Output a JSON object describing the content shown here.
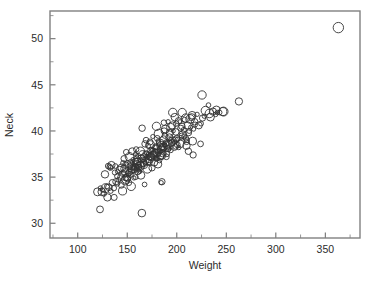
{
  "chart_data": {
    "type": "scatter",
    "title": "",
    "subtitle": "",
    "xlabel": "Weight",
    "ylabel": "Neck",
    "xlim": [
      72,
      385
    ],
    "ylim": [
      28.4,
      53.0
    ],
    "grid": false,
    "legend": null,
    "legend_position": "none",
    "marker": "open-circle",
    "marker_color": "#333333",
    "frame_color": "#808080",
    "xticks": [
      100,
      150,
      200,
      250,
      300,
      350
    ],
    "xtick_labels": [
      "100",
      "150",
      "200",
      "250",
      "300",
      "350"
    ],
    "xminor_step": 25,
    "yticks": [
      30,
      35,
      40,
      45,
      50
    ],
    "ytick_labels": [
      "30",
      "35",
      "40",
      "45",
      "50"
    ],
    "yminor_step": 2.5,
    "annotations": [
      {
        "text": "high-leverage outlier",
        "x": 363.15,
        "y": 51.2
      }
    ],
    "points": [
      [
        154.25,
        36.2
      ],
      [
        173.25,
        38.5
      ],
      [
        154.0,
        34.0
      ],
      [
        184.75,
        37.4
      ],
      [
        184.25,
        34.4
      ],
      [
        210.25,
        39.0
      ],
      [
        181.0,
        36.4
      ],
      [
        176.0,
        37.8
      ],
      [
        191.0,
        38.1
      ],
      [
        198.25,
        39.0
      ],
      [
        186.25,
        38.2
      ],
      [
        216.0,
        38.9
      ],
      [
        180.5,
        38.1
      ],
      [
        205.25,
        40.5
      ],
      [
        187.75,
        38.5
      ],
      [
        162.75,
        35.6
      ],
      [
        195.75,
        38.9
      ],
      [
        209.25,
        39.2
      ],
      [
        183.75,
        37.3
      ],
      [
        211.75,
        37.8
      ],
      [
        179.0,
        37.0
      ],
      [
        200.5,
        38.5
      ],
      [
        140.25,
        35.6
      ],
      [
        148.75,
        34.8
      ],
      [
        151.25,
        35.4
      ],
      [
        159.25,
        36.6
      ],
      [
        131.5,
        33.9
      ],
      [
        148.0,
        35.5
      ],
      [
        133.25,
        33.5
      ],
      [
        160.75,
        36.0
      ],
      [
        182.0,
        37.5
      ],
      [
        160.25,
        36.0
      ],
      [
        168.0,
        36.5
      ],
      [
        218.5,
        40.7
      ],
      [
        247.25,
        42.1
      ],
      [
        191.75,
        38.5
      ],
      [
        145.25,
        33.5
      ],
      [
        124.25,
        33.4
      ],
      [
        159.75,
        36.4
      ],
      [
        147.0,
        35.9
      ],
      [
        178.5,
        38.2
      ],
      [
        183.5,
        37.2
      ],
      [
        153.0,
        35.3
      ],
      [
        209.75,
        38.4
      ],
      [
        160.5,
        35.6
      ],
      [
        184.25,
        38.4
      ],
      [
        174.0,
        37.2
      ],
      [
        176.75,
        37.5
      ],
      [
        186.0,
        38.0
      ],
      [
        193.5,
        38.8
      ],
      [
        166.75,
        37.2
      ],
      [
        160.5,
        36.7
      ],
      [
        189.0,
        38.6
      ],
      [
        185.0,
        38.3
      ],
      [
        178.0,
        37.7
      ],
      [
        138.5,
        34.5
      ],
      [
        172.75,
        37.0
      ],
      [
        170.0,
        37.2
      ],
      [
        150.0,
        35.0
      ],
      [
        163.0,
        36.2
      ],
      [
        154.25,
        35.7
      ],
      [
        170.75,
        36.8
      ],
      [
        194.75,
        38.9
      ],
      [
        224.5,
        40.8
      ],
      [
        227.75,
        41.6
      ],
      [
        161.25,
        36.3
      ],
      [
        155.5,
        35.9
      ],
      [
        212.5,
        40.0
      ],
      [
        204.5,
        39.3
      ],
      [
        183.0,
        37.8
      ],
      [
        178.25,
        37.6
      ],
      [
        200.0,
        39.2
      ],
      [
        158.0,
        36.1
      ],
      [
        172.25,
        37.1
      ],
      [
        166.5,
        36.5
      ],
      [
        156.0,
        36.0
      ],
      [
        186.5,
        38.3
      ],
      [
        190.5,
        38.6
      ],
      [
        212.0,
        39.8
      ],
      [
        239.25,
        41.8
      ],
      [
        205.0,
        39.5
      ],
      [
        168.5,
        36.8
      ],
      [
        176.0,
        37.4
      ],
      [
        148.25,
        34.9
      ],
      [
        140.0,
        34.3
      ],
      [
        152.0,
        35.5
      ],
      [
        180.0,
        37.6
      ],
      [
        195.0,
        38.7
      ],
      [
        201.0,
        39.1
      ],
      [
        163.5,
        36.4
      ],
      [
        143.75,
        35.0
      ],
      [
        136.5,
        33.8
      ],
      [
        126.5,
        33.2
      ],
      [
        122.5,
        31.5
      ],
      [
        130.0,
        32.8
      ],
      [
        150.25,
        34.8
      ],
      [
        175.5,
        37.3
      ],
      [
        184.0,
        38.0
      ],
      [
        157.75,
        36.0
      ],
      [
        207.5,
        39.4
      ],
      [
        217.0,
        40.2
      ],
      [
        222.25,
        40.6
      ],
      [
        234.0,
        41.5
      ],
      [
        243.25,
        42.0
      ],
      [
        262.75,
        43.2
      ],
      [
        225.5,
        43.9
      ],
      [
        196.0,
        42.0
      ],
      [
        205.5,
        42.0
      ],
      [
        213.5,
        41.3
      ],
      [
        232.0,
        42.8
      ],
      [
        236.5,
        42.1
      ],
      [
        241.0,
        42.0
      ],
      [
        246.5,
        42.1
      ],
      [
        198.0,
        41.5
      ],
      [
        187.0,
        40.9
      ],
      [
        191.25,
        41.0
      ],
      [
        179.5,
        40.5
      ],
      [
        168.0,
        38.6
      ],
      [
        173.0,
        38.8
      ],
      [
        181.5,
        38.9
      ],
      [
        199.5,
        40.8
      ],
      [
        203.25,
        41.0
      ],
      [
        208.0,
        41.2
      ],
      [
        215.0,
        41.5
      ],
      [
        220.5,
        41.8
      ],
      [
        229.0,
        42.2
      ],
      [
        165.0,
        40.3
      ],
      [
        155.0,
        37.8
      ],
      [
        149.0,
        37.7
      ],
      [
        159.0,
        38.0
      ],
      [
        146.0,
        36.5
      ],
      [
        138.0,
        36.2
      ],
      [
        134.0,
        36.3
      ],
      [
        132.25,
        36.1
      ],
      [
        128.0,
        33.8
      ],
      [
        136.75,
        32.8
      ],
      [
        164.75,
        31.1
      ],
      [
        185.0,
        34.5
      ],
      [
        167.5,
        34.2
      ],
      [
        216.5,
        37.4
      ],
      [
        224.0,
        38.6
      ],
      [
        144.0,
        34.1
      ],
      [
        151.5,
        34.4
      ],
      [
        158.5,
        35.0
      ],
      [
        170.25,
        35.9
      ],
      [
        177.0,
        36.6
      ],
      [
        189.5,
        37.2
      ],
      [
        194.0,
        37.9
      ],
      [
        202.0,
        38.2
      ],
      [
        210.0,
        38.8
      ],
      [
        163.75,
        35.2
      ],
      [
        156.75,
        34.9
      ],
      [
        147.75,
        34.6
      ],
      [
        141.0,
        34.7
      ],
      [
        175.0,
        36.0
      ],
      [
        182.5,
        36.8
      ],
      [
        190.0,
        37.5
      ],
      [
        197.5,
        38.4
      ],
      [
        206.0,
        39.6
      ],
      [
        214.0,
        40.4
      ],
      [
        166.0,
        36.9
      ],
      [
        171.5,
        37.4
      ],
      [
        178.75,
        38.3
      ],
      [
        186.75,
        39.0
      ],
      [
        193.0,
        39.8
      ],
      [
        152.5,
        36.2
      ],
      [
        158.75,
        36.7
      ],
      [
        164.25,
        37.0
      ],
      [
        169.75,
        37.6
      ],
      [
        174.5,
        38.0
      ],
      [
        145.5,
        35.4
      ],
      [
        139.75,
        35.1
      ],
      [
        135.0,
        34.4
      ],
      [
        129.5,
        34.0
      ],
      [
        125.0,
        33.6
      ],
      [
        180.25,
        39.2
      ],
      [
        188.0,
        39.5
      ],
      [
        196.5,
        40.0
      ],
      [
        204.0,
        40.3
      ],
      [
        211.0,
        40.6
      ],
      [
        161.0,
        37.3
      ],
      [
        155.75,
        36.9
      ],
      [
        150.5,
        36.4
      ],
      [
        144.5,
        36.0
      ],
      [
        137.5,
        35.5
      ],
      [
        173.75,
        37.9
      ],
      [
        168.75,
        37.5
      ],
      [
        183.25,
        38.7
      ],
      [
        192.5,
        39.3
      ],
      [
        199.0,
        39.9
      ],
      [
        207.0,
        40.1
      ],
      [
        218.0,
        41.0
      ],
      [
        226.0,
        41.4
      ],
      [
        233.0,
        41.9
      ],
      [
        240.0,
        42.3
      ],
      [
        157.0,
        35.8
      ],
      [
        162.0,
        36.1
      ],
      [
        167.0,
        36.3
      ],
      [
        172.0,
        36.6
      ],
      [
        177.5,
        37.1
      ],
      [
        142.5,
        35.8
      ],
      [
        148.5,
        36.3
      ],
      [
        153.5,
        36.6
      ],
      [
        159.5,
        37.0
      ],
      [
        165.5,
        37.4
      ],
      [
        179.75,
        37.0
      ],
      [
        185.5,
        37.6
      ],
      [
        192.0,
        38.0
      ],
      [
        198.75,
        38.3
      ],
      [
        203.5,
        38.6
      ],
      [
        133.0,
        36.0
      ],
      [
        130.75,
        36.2
      ],
      [
        127.5,
        35.3
      ],
      [
        123.0,
        33.8
      ],
      [
        120.0,
        33.4
      ],
      [
        188.5,
        40.2
      ],
      [
        195.5,
        40.6
      ],
      [
        201.75,
        41.1
      ],
      [
        209.0,
        41.4
      ],
      [
        215.5,
        41.7
      ],
      [
        169.0,
        39.0
      ],
      [
        175.75,
        39.4
      ],
      [
        181.75,
        39.7
      ],
      [
        187.25,
        40.0
      ],
      [
        193.75,
        40.4
      ],
      [
        146.75,
        37.0
      ],
      [
        152.25,
        37.2
      ],
      [
        158.25,
        37.5
      ],
      [
        163.25,
        37.8
      ],
      [
        171.0,
        38.4
      ],
      [
        363.15,
        51.2
      ]
    ]
  },
  "axes": {
    "x_title": "Weight",
    "y_title": "Neck"
  }
}
